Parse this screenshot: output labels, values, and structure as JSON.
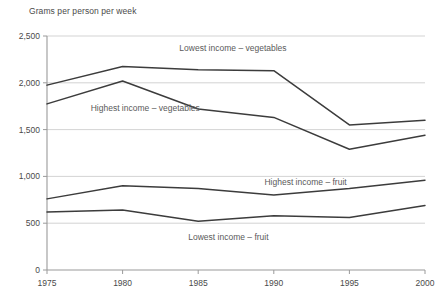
{
  "axis_title": "Grams per person per week",
  "chart_data": {
    "type": "line",
    "title": "Grams per person per week",
    "xlabel": "",
    "ylabel": "Grams per person per week",
    "x": [
      1975,
      1980,
      1985,
      1990,
      1995,
      2000
    ],
    "xtick_labels": [
      "1975",
      "1980",
      "1985",
      "1990",
      "1995",
      "2000"
    ],
    "ytick_labels": [
      "0",
      "500",
      "1,000",
      "1,500",
      "2,000",
      "2,500"
    ],
    "ytick_values": [
      0,
      500,
      1000,
      1500,
      2000,
      2500
    ],
    "ylim": [
      0,
      2500
    ],
    "xlim": [
      1975,
      2000
    ],
    "grid": "horizontal",
    "legend_position": "inline-labels",
    "series": [
      {
        "name": "Lowest income – vegetables",
        "label": "Lowest income – vegetables",
        "values": [
          1975,
          2175,
          2140,
          2130,
          1550,
          1600
        ],
        "label_x": 1987.3,
        "label_y": 2370
      },
      {
        "name": "Highest income – vegetables",
        "label": "Highest income – vegetables",
        "values": [
          1775,
          2020,
          1720,
          1630,
          1290,
          1440
        ],
        "label_x": 1981.5,
        "label_y": 1730
      },
      {
        "name": "Highest income – fruit",
        "label": "Highest income – fruit",
        "values": [
          760,
          900,
          870,
          800,
          870,
          960
        ],
        "label_x": 1992.1,
        "label_y": 940
      },
      {
        "name": "Lowest income – fruit",
        "label": "Lowest income – fruit",
        "values": [
          620,
          640,
          520,
          580,
          560,
          690
        ],
        "label_x": 1987.0,
        "label_y": 355
      }
    ]
  }
}
